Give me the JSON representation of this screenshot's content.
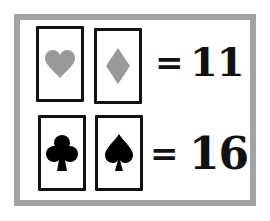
{
  "puzzle": {
    "rows": [
      {
        "cards": [
          {
            "suit": "heart",
            "icon": "heart-icon",
            "color": "#999999"
          },
          {
            "suit": "diamond",
            "icon": "diamond-icon",
            "color": "#999999"
          }
        ],
        "equals": "=",
        "value": "11"
      },
      {
        "cards": [
          {
            "suit": "club",
            "icon": "club-icon",
            "color": "#000000"
          },
          {
            "suit": "spade",
            "icon": "spade-icon",
            "color": "#000000"
          }
        ],
        "equals": "=",
        "value": "16"
      }
    ],
    "colors": {
      "frame": "#a3a3a3",
      "red_suits": "#999999",
      "black_suits": "#000000",
      "ink": "#111111"
    }
  }
}
